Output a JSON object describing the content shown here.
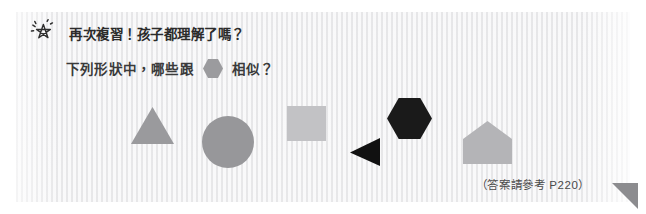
{
  "page": {
    "language": "zh-Hant",
    "background_color": "#ffffff",
    "panel_color": "#f5f5f6"
  },
  "header": {
    "icon": "star-sparkle-icon",
    "title": "再次複習！孩子都理解了嗎？",
    "title_color": "#2b2b2b"
  },
  "question": {
    "text_before": "下列形狀中，哪些跟",
    "inline_shape": "hexagon-icon",
    "inline_shape_color": "#9b9b9e",
    "text_after": "相似？",
    "text_color": "#3a3a3a"
  },
  "shapes": [
    {
      "id": "triangle-gray",
      "name": "triangle",
      "label": "灰色三角形",
      "color": "#9a9a9d",
      "points": "50,0 100,100 0,100"
    },
    {
      "id": "circle-gray",
      "name": "circle",
      "label": "灰色圓形",
      "color": "#97979a"
    },
    {
      "id": "square-gray",
      "name": "square",
      "label": "淺灰色正方形",
      "color": "#c2c2c5"
    },
    {
      "id": "triangle-black",
      "name": "triangle-left",
      "label": "黑色左向三角形",
      "color": "#111111",
      "points": "100,0 100,100 0,52"
    },
    {
      "id": "hexagon-black",
      "name": "hexagon",
      "label": "黑色六邊形",
      "color": "#1a1a1a",
      "points": "25,0 75,0 100,50 75,100 25,100 0,50"
    },
    {
      "id": "house-gray",
      "name": "pentagon-house",
      "label": "灰色房屋五邊形",
      "color": "#b4b4b7",
      "points": "50,0 100,42 100,100 0,100 0,42"
    }
  ],
  "footer": {
    "note": "（答案請參考 P220）",
    "note_color": "#4a4a4a",
    "corner_marker": "corner-triangle-icon",
    "corner_marker_color": "#8c8c8f"
  }
}
